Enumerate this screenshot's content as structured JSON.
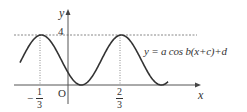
{
  "chart_data": {
    "type": "line",
    "title": "",
    "xlabel": "x",
    "ylabel": "y",
    "equation_label": "y = a cos b(x+c)+d",
    "function": {
      "a": 2,
      "b": "2π",
      "c": "1/3",
      "d": 2
    },
    "x_range": [
      -0.6,
      1.25
    ],
    "ylim": [
      0,
      4
    ],
    "series": [
      {
        "name": "y = a cos b(x+c)+d",
        "x": [
          -0.6,
          -0.5,
          -0.4,
          -0.333,
          -0.25,
          -0.1667,
          -0.0833,
          0,
          0.0833,
          0.1667,
          0.25,
          0.3333,
          0.4167,
          0.5,
          0.5833,
          0.6667,
          0.75,
          0.8333,
          0.9167,
          1.0,
          1.0833,
          1.1667,
          1.25
        ],
        "y": [
          2.71,
          3.73,
          3.92,
          4,
          3.73,
          3,
          2,
          1,
          0.27,
          0,
          0.27,
          1,
          2,
          3,
          3.73,
          4,
          3.73,
          3,
          2,
          1,
          0.27,
          0,
          0.27
        ]
      }
    ],
    "tick_labels": {
      "x": [
        {
          "value": -0.3333,
          "label": "-1/3"
        },
        {
          "value": 0.6667,
          "label": "2/3"
        }
      ],
      "y": [
        {
          "value": 4,
          "label": "4"
        }
      ]
    },
    "origin_label": "O",
    "guides": [
      {
        "type": "horizontal-dashed",
        "y": 4
      },
      {
        "type": "vertical-dotted",
        "x": -0.3333
      },
      {
        "type": "vertical-dotted",
        "x": 0.6667
      }
    ],
    "grid": false,
    "legend": "none"
  },
  "labels": {
    "y_axis": "y",
    "x_axis": "x",
    "y_tick_4": "4",
    "origin": "O",
    "xtick_neg_sign": "−",
    "xtick_neg_num": "1",
    "xtick_neg_den": "3",
    "xtick_pos_num": "2",
    "xtick_pos_den": "3",
    "equation": "y = a cos b(x+c)+d"
  },
  "colors": {
    "curve": "#333333",
    "axes": "#555555",
    "guides": "#888888"
  }
}
